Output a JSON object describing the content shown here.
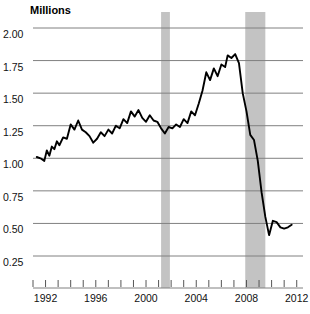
{
  "chart_data": {
    "type": "line",
    "title": "",
    "ylabel": "Millions",
    "xlabel": "",
    "ylim": [
      0.0,
      2.0
    ],
    "xlim": [
      1991.0,
      2012.5
    ],
    "grid": true,
    "legend": false,
    "y_ticks": [
      "0.25",
      "0.50",
      "0.75",
      "1.00",
      "1.25",
      "1.50",
      "1.75",
      "2.00"
    ],
    "y_tick_values": [
      0.25,
      0.5,
      0.75,
      1.0,
      1.25,
      1.5,
      1.75,
      2.0
    ],
    "x_ticks": [
      "1992",
      "1996",
      "2000",
      "2004",
      "2008",
      "2012"
    ],
    "x_tick_values": [
      1992,
      1996,
      2000,
      2004,
      2008,
      2012
    ],
    "minor_x_ticks": [
      1991,
      1992,
      1993,
      1994,
      1995,
      1996,
      1997,
      1998,
      1999,
      2000,
      2001,
      2002,
      2003,
      2004,
      2005,
      2006,
      2007,
      2008,
      2009,
      2010,
      2011,
      2012
    ],
    "line_color": "#000000",
    "grid_color": "#808080",
    "shaded_band_color": "#c3c3c3",
    "shaded_bands": [
      {
        "label": "2001 recession",
        "start": 2001.2,
        "end": 2001.9
      },
      {
        "label": "2007-2009 recession",
        "start": 2007.9,
        "end": 2009.5
      }
    ],
    "x": [
      1991.3,
      1991.6,
      1991.9,
      1992.1,
      1992.3,
      1992.5,
      1992.7,
      1992.9,
      1993.1,
      1993.4,
      1993.7,
      1994.0,
      1994.3,
      1994.6,
      1994.9,
      1995.2,
      1995.5,
      1995.8,
      1996.1,
      1996.4,
      1996.7,
      1997.0,
      1997.3,
      1997.6,
      1997.9,
      1998.2,
      1998.5,
      1998.8,
      1999.1,
      1999.4,
      1999.7,
      2000.0,
      2000.3,
      2000.6,
      2000.9,
      2001.2,
      2001.5,
      2001.8,
      2002.1,
      2002.4,
      2002.7,
      2003.0,
      2003.3,
      2003.6,
      2003.9,
      2004.2,
      2004.5,
      2004.8,
      2005.1,
      2005.4,
      2005.7,
      2006.0,
      2006.3,
      2006.5,
      2006.8,
      2007.1,
      2007.4,
      2007.7,
      2008.0,
      2008.3,
      2008.6,
      2008.9,
      2009.2,
      2009.5,
      2009.8,
      2010.1,
      2010.4,
      2010.7,
      2011.0,
      2011.3,
      2011.6
    ],
    "values": [
      1.01,
      1.0,
      0.98,
      1.06,
      1.02,
      1.09,
      1.07,
      1.13,
      1.1,
      1.16,
      1.15,
      1.26,
      1.22,
      1.29,
      1.22,
      1.2,
      1.17,
      1.12,
      1.15,
      1.2,
      1.17,
      1.22,
      1.19,
      1.25,
      1.23,
      1.3,
      1.27,
      1.36,
      1.32,
      1.37,
      1.31,
      1.28,
      1.33,
      1.29,
      1.28,
      1.23,
      1.19,
      1.24,
      1.23,
      1.26,
      1.24,
      1.3,
      1.27,
      1.36,
      1.33,
      1.42,
      1.52,
      1.66,
      1.6,
      1.69,
      1.63,
      1.72,
      1.7,
      1.79,
      1.77,
      1.8,
      1.73,
      1.5,
      1.36,
      1.18,
      1.14,
      0.98,
      0.74,
      0.55,
      0.41,
      0.52,
      0.51,
      0.47,
      0.46,
      0.47,
      0.49
    ]
  }
}
